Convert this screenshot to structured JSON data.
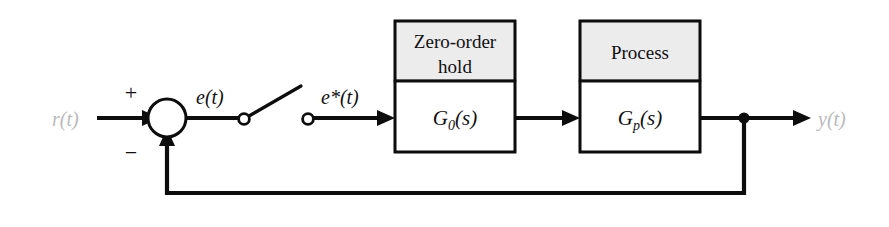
{
  "diagram": {
    "colors": {
      "line": "#0d0d0d",
      "block_header_fill": "#ececec",
      "block_body_fill": "#ffffff",
      "faded_label": "#b9b9b9",
      "background": "#ffffff"
    },
    "blocks": [
      {
        "id": "zero-order-hold",
        "header_line_1": "Zero-order",
        "header_line_2": "hold",
        "transfer_function": "G",
        "transfer_subscript": "0",
        "transfer_argument": "(s)"
      },
      {
        "id": "process",
        "header_line_1": "Process",
        "header_line_2": "",
        "transfer_function": "G",
        "transfer_subscript": "p",
        "transfer_argument": "(s)"
      }
    ],
    "signals": {
      "reference": "r(t)",
      "error": "e(t)",
      "sampled_error": "e*(t)",
      "output": "y(t)"
    },
    "summing_junction": {
      "plus_sign": "+",
      "minus_sign": "−"
    },
    "sampler": {
      "name": "sampling switch"
    }
  }
}
